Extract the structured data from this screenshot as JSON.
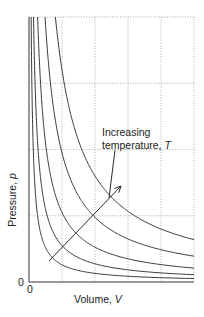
{
  "chart_data": {
    "type": "line",
    "title": "",
    "xlabel": "Volume, V",
    "ylabel": "Pressure, p",
    "x_tick_labels": [
      "0"
    ],
    "y_tick_labels": [
      "0"
    ],
    "grid": true,
    "grid_columns": 5,
    "grid_rows": 4,
    "xlim": [
      0,
      5
    ],
    "ylim": [
      0,
      4
    ],
    "annotation": {
      "text_line1": "Increasing",
      "text_line2": "temperature, T",
      "arrow_from": [
        0.6,
        0.32
      ],
      "arrow_to": [
        2.8,
        2.9
      ]
    },
    "series": [
      {
        "name": "T1",
        "relation": "pV = k",
        "k": 0.26
      },
      {
        "name": "T2",
        "relation": "pV = k",
        "k": 0.55
      },
      {
        "name": "T3",
        "relation": "pV = k",
        "k": 1.05
      },
      {
        "name": "T4",
        "relation": "pV = k",
        "k": 1.95
      },
      {
        "name": "T5",
        "relation": "pV = k",
        "k": 3.2
      }
    ]
  },
  "labels": {
    "x_axis": "Volume, ",
    "x_axis_var": "V",
    "y_axis": "Pressure, ",
    "y_axis_var": "p",
    "x_origin": "0",
    "y_origin": "0",
    "annotation_line1": "Increasing",
    "annotation_line2": "temperature, ",
    "annotation_var": "T"
  }
}
